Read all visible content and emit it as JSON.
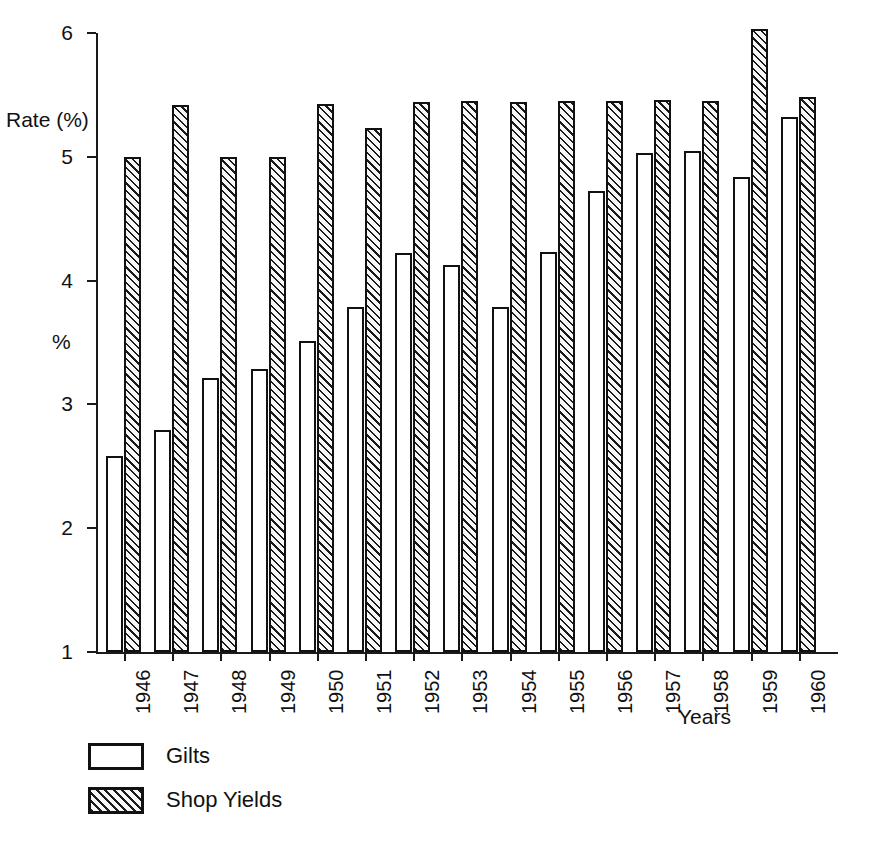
{
  "chart_data": {
    "type": "bar",
    "title": "",
    "subtitle": "",
    "xlabel": "Years",
    "ylabel": "Rate (%)",
    "ylabel_secondary": "%",
    "ylim": [
      1,
      6
    ],
    "yticks": [
      1,
      2,
      3,
      4,
      5,
      6
    ],
    "ytick_labels": [
      "1",
      "2",
      "3",
      "4",
      "5",
      "6"
    ],
    "grid": false,
    "legend_position": "bottom-left",
    "categories": [
      "1946",
      "1947",
      "1948",
      "1949",
      "1950",
      "1951",
      "1952",
      "1953",
      "1954",
      "1955",
      "1956",
      "1957",
      "1958",
      "1959",
      "1960"
    ],
    "series": [
      {
        "name": "Gilts",
        "style": "outline",
        "color": "#ffffff",
        "edge_color": "#111111",
        "values": [
          2.58,
          2.79,
          3.21,
          3.29,
          3.51,
          3.79,
          4.22,
          4.13,
          3.79,
          4.23,
          4.72,
          5.03,
          5.05,
          4.84,
          5.32
        ]
      },
      {
        "name": "Shop Yields",
        "style": "hatched",
        "color": "#f2f2f2",
        "edge_color": "#111111",
        "values": [
          5.0,
          5.42,
          5.0,
          5.0,
          5.43,
          5.23,
          5.44,
          5.45,
          5.44,
          5.45,
          5.45,
          5.46,
          5.45,
          6.03,
          5.48
        ]
      }
    ]
  },
  "axes": {
    "y_title": "Rate (%)",
    "y_title_secondary": "%",
    "x_title": "Years"
  },
  "legend": {
    "items": [
      {
        "label": "Gilts",
        "style": "outline"
      },
      {
        "label": "Shop Yields",
        "style": "hatched"
      }
    ]
  }
}
